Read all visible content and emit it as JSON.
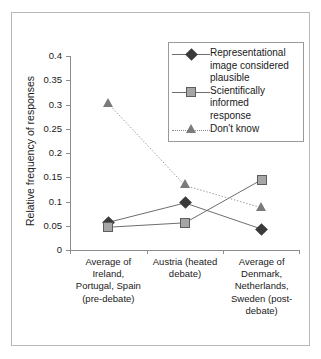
{
  "chart_data": {
    "type": "line",
    "title": "",
    "xlabel": "",
    "ylabel": "Relative frequency of responses",
    "ylim": [
      0,
      0.4
    ],
    "yticks": [
      "0",
      "0.05",
      "0.1",
      "0.15",
      "0.2",
      "0.25",
      "0.3",
      "0.35",
      "0.4"
    ],
    "ytick_values": [
      0,
      0.05,
      0.1,
      0.15,
      0.2,
      0.25,
      0.3,
      0.35,
      0.4
    ],
    "grid": false,
    "legend_position": "top-right",
    "categories": [
      "Average of Ireland, Portugal, Spain (pre-debate)",
      "Austria (heated debate)",
      "Average of Denmark, Netherlands, Sweden (post-debate)"
    ],
    "category_lines": [
      [
        "Average of",
        "Ireland,",
        "Portugal, Spain",
        "(pre-debate)"
      ],
      [
        "Austria (heated",
        "debate)"
      ],
      [
        "Average of",
        "Denmark,",
        "Netherlands,",
        "Sweden (post-",
        "debate)"
      ]
    ],
    "series": [
      {
        "name": "Representational image considered plausible",
        "name_lines": [
          "Representational",
          "image considered",
          "plausible"
        ],
        "marker": "diamond",
        "linestyle": "solid",
        "color": "#3a3a3a",
        "values": [
          0.057,
          0.097,
          0.043
        ]
      },
      {
        "name": "Scientifically informed response",
        "name_lines": [
          "Scientifically",
          "informed",
          "response"
        ],
        "marker": "square",
        "linestyle": "solid",
        "color": "#a6a6a6",
        "values": [
          0.047,
          0.056,
          0.145
        ]
      },
      {
        "name": "Don't know",
        "name_lines": [
          "Don't know"
        ],
        "marker": "triangle",
        "linestyle": "dotted",
        "color": "#7b7b7b",
        "values": [
          0.302,
          0.133,
          0.087
        ]
      }
    ]
  },
  "axis": {
    "y_title": "Relative frequency of responses"
  },
  "legend": {
    "entries": [
      {
        "label": "Representational image considered plausible"
      },
      {
        "label": "Scientifically informed response"
      },
      {
        "label": "Don't know"
      }
    ]
  }
}
